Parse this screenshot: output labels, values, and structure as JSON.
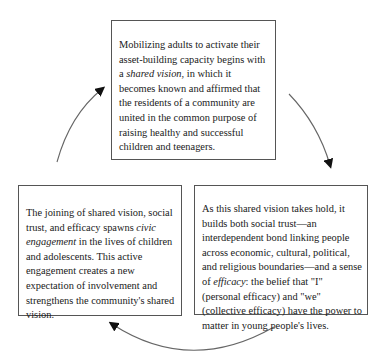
{
  "diagram": {
    "type": "cycle",
    "nodes": [
      {
        "id": "shared-vision",
        "position": "top",
        "text_parts": [
          "Mobilizing adults to activate their asset-building capacity begins with a ",
          "shared vision",
          ", in which it becomes known and affirmed that the residents of a community are united in the common purpose of raising healthy and successful children and teenagers."
        ],
        "emphasis": "shared vision"
      },
      {
        "id": "social-trust-efficacy",
        "position": "bottom-right",
        "text_parts": [
          "As this shared vision takes hold, it builds both social trust—an interdependent bond linking people across economic, cultural, political, and religious boundaries—and a sense of ",
          "efficacy",
          ": the belief that \"I\" (personal efficacy) and \"we\" (collective efficacy) have the power to matter in young people's lives."
        ],
        "emphasis": "efficacy"
      },
      {
        "id": "civic-engagement",
        "position": "bottom-left",
        "text_parts": [
          "The joining of shared vision, social trust, and efficacy spawns ",
          "civic engagement",
          " in the lives of children and adolescents. This active engagement creates a new expectation of involvement and strengthens the community's shared vision."
        ],
        "emphasis": "civic engagement"
      }
    ],
    "edges": [
      {
        "from": "shared-vision",
        "to": "social-trust-efficacy",
        "direction": "clockwise"
      },
      {
        "from": "social-trust-efficacy",
        "to": "civic-engagement",
        "direction": "clockwise"
      },
      {
        "from": "civic-engagement",
        "to": "shared-vision",
        "direction": "clockwise"
      }
    ],
    "colors": {
      "border": "#555555",
      "arrow": "#555555",
      "arrowhead": "#111111",
      "text": "#1a1a1a"
    }
  }
}
